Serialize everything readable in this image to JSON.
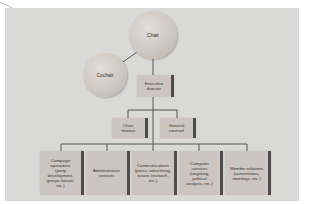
{
  "diagram": {
    "type": "organizational-chart",
    "nodes": {
      "chair": "Chair",
      "cochair": "Cochair",
      "executive_director": "Executive\ndirector",
      "chair_finance": "Chair,\nfinance",
      "general_counsel": "General\ncounsel",
      "campaign_operations": "Campaign\noperations\n(party\ndevelopment,\ngroups liaison,\netc.)",
      "administrative_services": "Administrative\nservices",
      "communications": "Communications\n(press, advertising,\nissues research,\netc.)",
      "computer_services": "Computer\nservices\n(targeting,\npolitical\nanalysis, etc.)",
      "member_relations": "Member relations\n(conventions,\nmeetings, etc.)"
    },
    "edges": [
      [
        "chair",
        "cochair"
      ],
      [
        "chair",
        "executive_director"
      ],
      [
        "executive_director",
        "chair_finance"
      ],
      [
        "executive_director",
        "general_counsel"
      ],
      [
        "executive_director",
        "campaign_operations"
      ],
      [
        "executive_director",
        "administrative_services"
      ],
      [
        "executive_director",
        "communications"
      ],
      [
        "executive_director",
        "computer_services"
      ],
      [
        "executive_director",
        "member_relations"
      ]
    ],
    "colors": {
      "panel": "#d9d9d8",
      "box": "#ccc5c1",
      "box_bar": "#4d4d4d",
      "line": "#555555"
    }
  }
}
